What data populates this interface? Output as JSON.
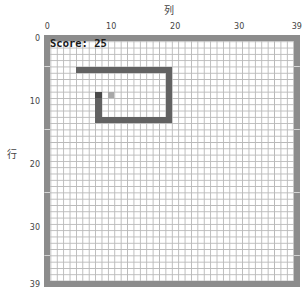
{
  "axes": {
    "x_label": "列",
    "y_label": "行",
    "x_ticks": [
      {
        "label": "0",
        "value": 0
      },
      {
        "label": "10",
        "value": 10
      },
      {
        "label": "20",
        "value": 20
      },
      {
        "label": "30",
        "value": 30
      },
      {
        "label": "39",
        "value": 39
      }
    ],
    "y_ticks": [
      {
        "label": "0",
        "value": 0
      },
      {
        "label": "10",
        "value": 10
      },
      {
        "label": "20",
        "value": 20
      },
      {
        "label": "30",
        "value": 30
      },
      {
        "label": "39",
        "value": 39
      }
    ]
  },
  "game": {
    "score_text": "Score: 25",
    "grid_size": 40,
    "colors": {
      "wall": "#8c8c8c",
      "snake": "#626262",
      "head": "#4a4a4a",
      "food": "#a8a8a8",
      "grid_line": "#b9b9b9",
      "background": "#ffffff"
    },
    "food": {
      "row": 9,
      "col": 10
    },
    "snake": [
      [
        9,
        8
      ],
      [
        10,
        8
      ],
      [
        11,
        8
      ],
      [
        12,
        8
      ],
      [
        13,
        8
      ],
      [
        13,
        9
      ],
      [
        13,
        10
      ],
      [
        13,
        11
      ],
      [
        13,
        12
      ],
      [
        13,
        13
      ],
      [
        13,
        14
      ],
      [
        13,
        15
      ],
      [
        13,
        16
      ],
      [
        13,
        17
      ],
      [
        13,
        18
      ],
      [
        13,
        19
      ],
      [
        12,
        19
      ],
      [
        11,
        19
      ],
      [
        10,
        19
      ],
      [
        9,
        19
      ],
      [
        8,
        19
      ],
      [
        7,
        19
      ],
      [
        6,
        19
      ],
      [
        5,
        19
      ],
      [
        5,
        18
      ],
      [
        5,
        17
      ],
      [
        5,
        16
      ],
      [
        5,
        15
      ],
      [
        5,
        14
      ],
      [
        5,
        13
      ],
      [
        5,
        12
      ],
      [
        5,
        11
      ],
      [
        5,
        10
      ],
      [
        5,
        9
      ],
      [
        5,
        8
      ],
      [
        5,
        7
      ],
      [
        5,
        6
      ],
      [
        5,
        5
      ]
    ]
  }
}
